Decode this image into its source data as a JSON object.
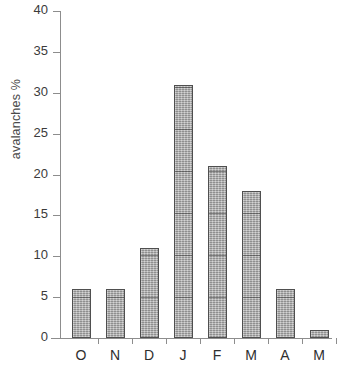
{
  "chart_data": {
    "type": "bar",
    "title": "",
    "subtitle": "",
    "xlabel": "",
    "ylabel": "avalanches %",
    "categories": [
      "O",
      "N",
      "D",
      "J",
      "F",
      "M",
      "A",
      "M"
    ],
    "values": [
      6,
      6,
      11,
      31,
      21,
      18,
      6,
      1
    ],
    "series": [
      {
        "name": "avalanches %",
        "values": [
          6,
          6,
          11,
          31,
          21,
          18,
          6,
          1
        ]
      }
    ],
    "ylim": [
      0,
      40
    ],
    "y_ticks": [
      0,
      5,
      10,
      15,
      20,
      25,
      30,
      35,
      40
    ],
    "y_tick_labels": [
      "0",
      "5",
      "10",
      "15",
      "20",
      "25",
      "30",
      "35",
      "40"
    ],
    "grid": false,
    "legend": false,
    "legend_position": "none",
    "annotations": [],
    "bar_color": "#ababab",
    "bar_edge_color": "#4f4f4f",
    "axis_color": "#8d8d8d",
    "text_color": "#2e2e2e",
    "background_color": "#ffffff"
  }
}
